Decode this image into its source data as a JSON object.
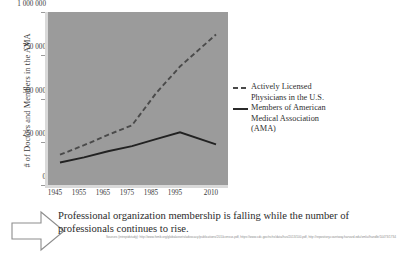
{
  "figure": {
    "ylabel": "# of Doctors and Members in the AMA",
    "yticks": [
      "1 000 000",
      "750 000",
      "500 000",
      "250 000",
      "0"
    ],
    "xticks": [
      "1945",
      "1955",
      "1965",
      "1975",
      "1985",
      "1995",
      "2010"
    ],
    "legend": {
      "series1_line1": "Actively Licensed",
      "series1_line2": "Physicians in the U.S.",
      "series2_line1": "Members of American",
      "series2_line2": "Medical Association",
      "series2_line3": "(AMA)"
    },
    "colors": {
      "plot_background": "#9b9b9b",
      "axis": "#d9d9d9",
      "physicians_line": "#4a4a4a",
      "ama_line": "#222222",
      "text": "#2b2b2b"
    }
  },
  "caption": {
    "line1": "Professional organization membership is falling while the number of",
    "line2": "professionals continues to rise.",
    "arrow_icon": "right-arrow-icon"
  },
  "sources": "Sources (intrepidstudy): http://www.fsmb.org/globalassets/advocacy/publications/2010census.pdf, https://www.cdc.gov/nchs/data/hus/2013/100.pdf, http://repository.countway.harvard.edu/xmlui/handle/10473/1734",
  "chart_data": {
    "type": "line",
    "title": "",
    "xlabel": "",
    "ylabel": "# of Doctors and Members in the AMA",
    "x": [
      1945,
      1955,
      1965,
      1975,
      1985,
      1995,
      2010
    ],
    "xlim": [
      1940,
      2015
    ],
    "ylim": [
      0,
      1000000
    ],
    "ytick_values": [
      0,
      250000,
      500000,
      750000,
      1000000
    ],
    "grid": false,
    "legend_position": "right",
    "series": [
      {
        "name": "Actively Licensed Physicians in the U.S.",
        "style": "dashed",
        "color": "#4a4a4a",
        "values": [
          175000,
          230000,
          290000,
          345000,
          530000,
          685000,
          870000
        ]
      },
      {
        "name": "Members of American Medical Association (AMA)",
        "style": "solid",
        "color": "#222222",
        "values": [
          130000,
          160000,
          195000,
          225000,
          265000,
          305000,
          235000
        ]
      }
    ]
  }
}
